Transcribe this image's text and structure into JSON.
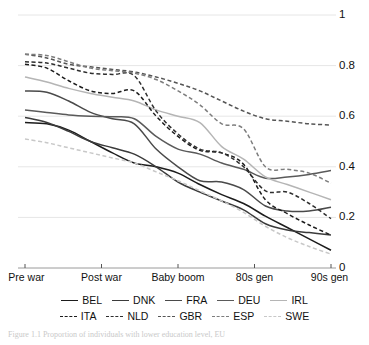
{
  "chart_data": {
    "type": "line",
    "title": "",
    "subtitle": "",
    "xlabel": "",
    "ylabel": "",
    "x": [
      "Pre war",
      "Post war",
      "Baby boom",
      "80s gen",
      "90s gen"
    ],
    "categories": [
      "Pre war",
      "Post war",
      "Baby boom",
      "80s gen",
      "90s gen"
    ],
    "xticklabels": [
      "Pre war",
      "Post war",
      "Baby boom",
      "80s gen",
      "90s gen"
    ],
    "yticklabels": [
      "1",
      "0.8",
      "0.6",
      "0.4",
      "0.2",
      "0"
    ],
    "ytickvalues": [
      1,
      0.8,
      0.6,
      0.4,
      0.2,
      0
    ],
    "ylim": [
      0,
      1
    ],
    "xlim": [
      0,
      4
    ],
    "grid": "horizontal",
    "legend_position": "bottom",
    "y_axis_side": "right",
    "series": [
      {
        "name": "BEL",
        "style": "solid",
        "color": "#1c1c1c",
        "values": [
          0.575,
          0.415,
          0.33,
          0.205,
          0.07
        ],
        "points": [
          0.575,
          0.57,
          0.545,
          0.5,
          0.455,
          0.415,
          0.4,
          0.375,
          0.33,
          0.29,
          0.255,
          0.205,
          0.16,
          0.115,
          0.07
        ]
      },
      {
        "name": "DNK",
        "style": "solid",
        "color": "#3b3b3b",
        "values": [
          0.595,
          0.45,
          0.3,
          0.175,
          0.13
        ],
        "points": [
          0.595,
          0.575,
          0.54,
          0.5,
          0.475,
          0.45,
          0.4,
          0.34,
          0.3,
          0.265,
          0.23,
          0.175,
          0.15,
          0.14,
          0.13
        ]
      },
      {
        "name": "FRA",
        "style": "solid",
        "color": "#4a4a4a",
        "values": [
          0.7,
          0.57,
          0.345,
          0.245,
          0.24
        ],
        "points": [
          0.7,
          0.695,
          0.66,
          0.615,
          0.59,
          0.57,
          0.47,
          0.4,
          0.345,
          0.34,
          0.31,
          0.245,
          0.225,
          0.225,
          0.24
        ]
      },
      {
        "name": "DEU",
        "style": "solid",
        "color": "#5a5a5a",
        "values": [
          0.625,
          0.59,
          0.45,
          0.355,
          0.385
        ],
        "points": [
          0.625,
          0.615,
          0.605,
          0.6,
          0.598,
          0.59,
          0.52,
          0.47,
          0.45,
          0.415,
          0.39,
          0.355,
          0.36,
          0.37,
          0.385
        ]
      },
      {
        "name": "IRL",
        "style": "solid",
        "color": "#b5b5b5",
        "values": [
          0.755,
          0.66,
          0.575,
          0.36,
          0.27
        ],
        "points": [
          0.755,
          0.735,
          0.71,
          0.69,
          0.675,
          0.66,
          0.625,
          0.6,
          0.575,
          0.48,
          0.43,
          0.36,
          0.33,
          0.3,
          0.27
        ]
      },
      {
        "name": "ITA",
        "style": "dashed",
        "color": "#1c1c1c",
        "values": [
          0.805,
          0.7,
          0.465,
          0.27,
          0.13
        ],
        "points": [
          0.805,
          0.79,
          0.74,
          0.7,
          0.69,
          0.7,
          0.6,
          0.52,
          0.465,
          0.455,
          0.41,
          0.27,
          0.215,
          0.17,
          0.13
        ]
      },
      {
        "name": "NLD",
        "style": "dashed",
        "color": "#2e2e2e",
        "values": [
          0.815,
          0.76,
          0.47,
          0.305,
          0.195
        ],
        "points": [
          0.815,
          0.81,
          0.79,
          0.77,
          0.765,
          0.76,
          0.62,
          0.53,
          0.47,
          0.455,
          0.4,
          0.305,
          0.3,
          0.255,
          0.195
        ]
      },
      {
        "name": "GBR",
        "style": "dashed",
        "color": "#555555",
        "values": [
          0.845,
          0.775,
          0.7,
          0.59,
          0.565
        ],
        "points": [
          0.845,
          0.83,
          0.805,
          0.795,
          0.785,
          0.775,
          0.755,
          0.73,
          0.7,
          0.66,
          0.62,
          0.59,
          0.58,
          0.57,
          0.565
        ]
      },
      {
        "name": "ESP",
        "style": "dashed",
        "color": "#7d7d7d",
        "values": [
          0.845,
          0.77,
          0.645,
          0.4,
          0.335
        ],
        "points": [
          0.845,
          0.84,
          0.815,
          0.79,
          0.78,
          0.77,
          0.745,
          0.7,
          0.645,
          0.57,
          0.55,
          0.4,
          0.39,
          0.375,
          0.335
        ]
      },
      {
        "name": "SWE",
        "style": "dashed",
        "color": "#c8c8c8",
        "values": [
          0.51,
          0.415,
          0.305,
          0.165,
          0.055
        ],
        "points": [
          0.51,
          0.495,
          0.475,
          0.455,
          0.435,
          0.415,
          0.38,
          0.345,
          0.305,
          0.265,
          0.22,
          0.165,
          0.12,
          0.085,
          0.055
        ]
      }
    ]
  },
  "legend": {
    "rows": [
      [
        {
          "label": "BEL",
          "style": "solid",
          "color": "#1c1c1c"
        },
        {
          "label": "DNK",
          "style": "solid",
          "color": "#3b3b3b"
        },
        {
          "label": "FRA",
          "style": "solid",
          "color": "#4a4a4a"
        },
        {
          "label": "DEU",
          "style": "solid",
          "color": "#5a5a5a"
        },
        {
          "label": "IRL",
          "style": "solid",
          "color": "#b5b5b5"
        }
      ],
      [
        {
          "label": "ITA",
          "style": "dashed",
          "color": "#1c1c1c"
        },
        {
          "label": "NLD",
          "style": "dashed",
          "color": "#2e2e2e"
        },
        {
          "label": "GBR",
          "style": "dashed",
          "color": "#555555"
        },
        {
          "label": "ESP",
          "style": "dashed",
          "color": "#7d7d7d"
        },
        {
          "label": "SWE",
          "style": "dashed",
          "color": "#c8c8c8"
        }
      ]
    ]
  },
  "caption": {
    "text": "Figure 1.1 Proportion of individuals with lower education level, EU"
  },
  "colors": {
    "gridline": "#e6e6e6",
    "axis": "#9a9a9a",
    "text": "#111111"
  }
}
